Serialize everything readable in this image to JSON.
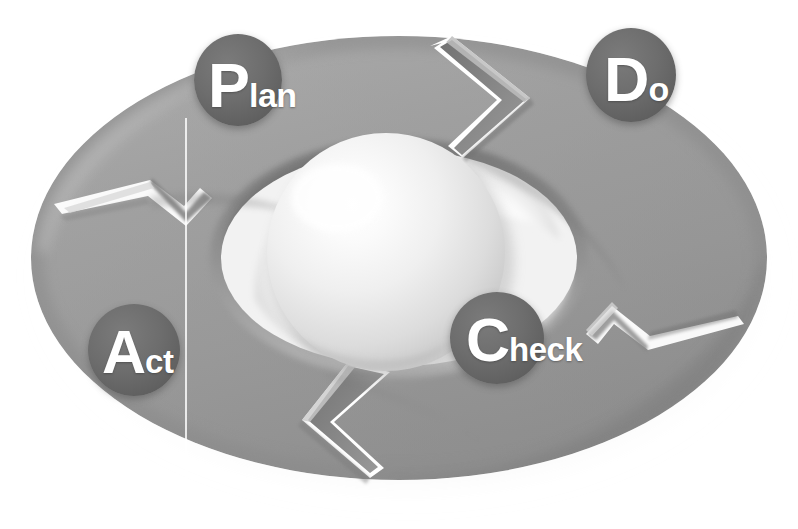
{
  "diagram": {
    "name": "PDCA Cycle (Deming Wheel)",
    "type": "cyclic-process-ring",
    "background_color": "#ffffff",
    "ring_color": "#9a9a9a",
    "ring_shadow_color": "#6f6f6f",
    "label_disc_color": "#6d6d6d",
    "label_text_color": "#ffffff",
    "sphere_color": "#e8e8e8",
    "segment_count": 4,
    "rotation_direction": "clockwise"
  },
  "center_sphere": {
    "name": "center-sphere",
    "highlight_color": "#ffffff",
    "base_color": "#dedede"
  },
  "guide_line": {
    "name": "vertical-guide-line",
    "color": "#ffffff"
  },
  "labels": [
    {
      "id": "plan",
      "full": "Plan",
      "initial": "P",
      "rest": "lan",
      "position": "top-left",
      "order": 1
    },
    {
      "id": "do",
      "full": "Do",
      "initial": "D",
      "rest": "o",
      "position": "top-right",
      "order": 2
    },
    {
      "id": "check",
      "full": "Check",
      "initial": "C",
      "rest": "heck",
      "position": "bottom-right",
      "order": 3
    },
    {
      "id": "act",
      "full": "Act",
      "initial": "A",
      "rest": "ct",
      "position": "bottom-left",
      "order": 4
    }
  ]
}
